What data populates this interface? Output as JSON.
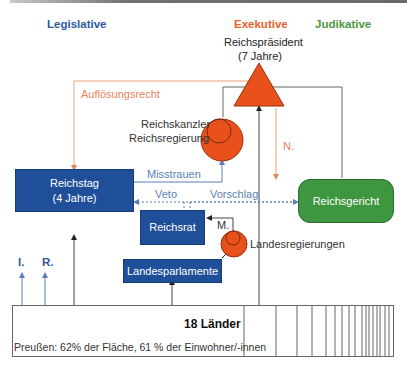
{
  "headers": {
    "legislative": "Legislative",
    "executive": "Exekutive",
    "judicative": "Judikative"
  },
  "colors": {
    "legislative": "#2a5aa0",
    "executive": "#e8612c",
    "judicative": "#4a9a3c",
    "box_blue": "#1f4f99",
    "box_green": "#3f9640",
    "orange_line": "#f0a070",
    "blue_line": "#5b7fb5",
    "gray_line": "#555555"
  },
  "nodes": {
    "president": {
      "name": "Reichspräsident",
      "term": "(7 Jahre)"
    },
    "chancellor": {
      "line1": "Reichskanzler",
      "line2": "Reichsregierung"
    },
    "reichstag": {
      "name": "Reichstag",
      "term": "(4 Jahre)"
    },
    "reichsrat": {
      "name": "Reichsrat"
    },
    "landesregierungen": {
      "name": "Landesregierungen"
    },
    "landesparlamente": {
      "name": "Landesparlamente"
    },
    "reichsgericht": {
      "name": "Reichsgericht"
    }
  },
  "edges": {
    "aufloesungsrecht": "Auflösungsrecht",
    "misstrauen": "Misstrauen",
    "veto": "Veto",
    "vorschlag": "Vorschlag",
    "n": "N.",
    "m": "M.",
    "i": "I.",
    "r": "R."
  },
  "laender": {
    "title": "18 Länder",
    "note": "Preußen: 62% der Fläche, 61 % der Einwohner/-innen",
    "divider_x": [
      244,
      276,
      297,
      312,
      326,
      335,
      342,
      349,
      355,
      362,
      366,
      369,
      373,
      377,
      380,
      385,
      389
    ]
  }
}
